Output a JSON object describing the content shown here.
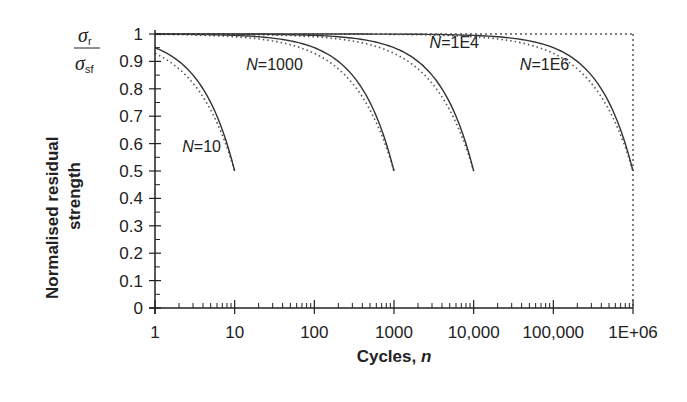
{
  "chart_data": {
    "type": "line",
    "title": "",
    "xlabel": "Cycles, n",
    "xlabel_main": "Cycles, ",
    "xlabel_var": "n",
    "ylabel_line1": "Normalised residual",
    "ylabel_line2": "strength",
    "ylabel_ratio": {
      "numerator": "σ",
      "numerator_sub": "r",
      "denominator": "σ",
      "denominator_sub": "sf"
    },
    "xscale": "log",
    "xlim": [
      1,
      1000000
    ],
    "ylim": [
      0,
      1
    ],
    "x_ticks": [
      {
        "value": 1,
        "label": "1"
      },
      {
        "value": 10,
        "label": "10"
      },
      {
        "value": 100,
        "label": "100"
      },
      {
        "value": 1000,
        "label": "1000"
      },
      {
        "value": 10000,
        "label": "10,000"
      },
      {
        "value": 100000,
        "label": "100,000"
      },
      {
        "value": 1000000,
        "label": "1E+06"
      }
    ],
    "y_ticks": [
      {
        "value": 0,
        "label": "0"
      },
      {
        "value": 0.1,
        "label": "0.1"
      },
      {
        "value": 0.2,
        "label": "0.2"
      },
      {
        "value": 0.3,
        "label": "0.3"
      },
      {
        "value": 0.4,
        "label": "0.4"
      },
      {
        "value": 0.5,
        "label": "0.5"
      },
      {
        "value": 0.6,
        "label": "0.6"
      },
      {
        "value": 0.7,
        "label": "0.7"
      },
      {
        "value": 0.8,
        "label": "0.8"
      },
      {
        "value": 0.9,
        "label": "0.9"
      },
      {
        "value": 1,
        "label": "1"
      }
    ],
    "grid": false,
    "legend": "none (curves labelled inline)",
    "series": [
      {
        "name": "N=10",
        "N": 10,
        "style": "solid+dotted",
        "end_strength": 0.5,
        "points": [
          [
            1,
            0.95
          ],
          [
            2,
            0.9
          ],
          [
            4,
            0.8
          ],
          [
            6,
            0.7
          ],
          [
            8,
            0.6
          ],
          [
            10,
            0.5
          ]
        ],
        "label": {
          "prefix": "N",
          "suffix": "=10",
          "at": [
            2.2,
            0.57
          ]
        }
      },
      {
        "name": "N=1000",
        "N": 1000,
        "style": "solid+dotted",
        "end_strength": 0.5,
        "points": [
          [
            1,
            1.0
          ],
          [
            10,
            0.995
          ],
          [
            100,
            0.95
          ],
          [
            300,
            0.85
          ],
          [
            600,
            0.7
          ],
          [
            1000,
            0.5
          ]
        ],
        "label": {
          "prefix": "N",
          "suffix": "=1000",
          "at": [
            14,
            0.87
          ]
        }
      },
      {
        "name": "N=1E4",
        "N": 10000,
        "style": "solid+dotted",
        "end_strength": 0.5,
        "points": [
          [
            1,
            1.0
          ],
          [
            100,
            0.995
          ],
          [
            1000,
            0.95
          ],
          [
            3000,
            0.85
          ],
          [
            6000,
            0.7
          ],
          [
            10000,
            0.5
          ]
        ],
        "label": {
          "prefix": "N",
          "suffix": "=1E4",
          "at": [
            2800,
            0.95
          ]
        }
      },
      {
        "name": "N=1E6",
        "N": 1000000,
        "style": "solid+dotted",
        "end_strength": 0.5,
        "points": [
          [
            1,
            1.0
          ],
          [
            10000,
            0.995
          ],
          [
            100000,
            0.95
          ],
          [
            300000,
            0.85
          ],
          [
            600000,
            0.7
          ],
          [
            1000000,
            0.5
          ]
        ],
        "label": {
          "prefix": "N",
          "suffix": "=1E6",
          "at": [
            38000,
            0.87
          ]
        }
      }
    ],
    "reference_line": {
      "y": 1,
      "style": "dotted",
      "extends_to_right_edge": true
    }
  },
  "colors": {
    "line": "#333333",
    "dotted": "#555555",
    "axis": "#222222",
    "background": "#ffffff"
  }
}
